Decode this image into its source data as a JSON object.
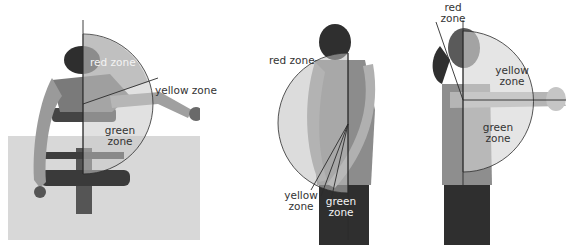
{
  "panels": [
    {
      "id": "prone-lateral-raise",
      "zones": {
        "red": "red zone",
        "yellow": "yellow zone",
        "green": [
          "green",
          "zone"
        ]
      }
    },
    {
      "id": "standing-shoulder-extension",
      "zones": {
        "red": "red zone",
        "yellow": [
          "yellow",
          "zone"
        ],
        "green": [
          "green",
          "zone"
        ]
      }
    },
    {
      "id": "standing-front-raise",
      "zones": {
        "red": [
          "red",
          "zone"
        ],
        "yellow": [
          "yellow",
          "zone"
        ],
        "green": [
          "green",
          "zone"
        ]
      }
    }
  ],
  "colors": {
    "background": "#ffffff",
    "floor": "#d9d9d9",
    "figure": "#8a8a8a",
    "figure_dark": "#3a3a3a",
    "zone_overlay": "#bdbdbd",
    "line": "#2b2b2b"
  }
}
